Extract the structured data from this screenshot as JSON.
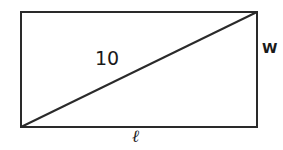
{
  "diagram": {
    "type": "rectangle-with-diagonal",
    "rectangle": {
      "x": 21,
      "y": 12,
      "width": 236,
      "height": 115
    },
    "diagonal": {
      "from": "bottom-left",
      "to": "top-right"
    },
    "stroke_color": "#2a2a2a",
    "labels": {
      "diagonal": "10",
      "width": "W",
      "length": "ℓ"
    }
  }
}
